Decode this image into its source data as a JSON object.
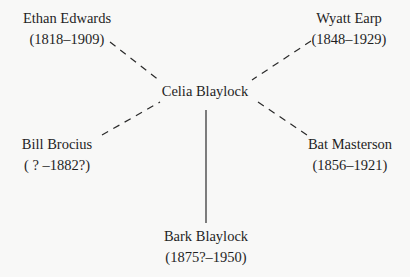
{
  "diagram": {
    "center": {
      "name": "Celia Blaylock"
    },
    "nodes": [
      {
        "id": "ethan",
        "name": "Ethan Edwards",
        "dates": "(1818–1909)",
        "link": "dashed"
      },
      {
        "id": "wyatt",
        "name": "Wyatt Earp",
        "dates": "(1848–1929)",
        "link": "dashed"
      },
      {
        "id": "bill",
        "name": "Bill Brocius",
        "dates": "( ? –1882?)",
        "link": "dashed"
      },
      {
        "id": "bat",
        "name": "Bat Masterson",
        "dates": "(1856–1921)",
        "link": "dashed"
      },
      {
        "id": "bark",
        "name": "Bark Blaylock",
        "dates": "(1875?–1950)",
        "link": "solid"
      }
    ],
    "colors": {
      "line": "#2a2a2a",
      "text": "#1f1f1f",
      "background": "#f8f8f7"
    }
  }
}
